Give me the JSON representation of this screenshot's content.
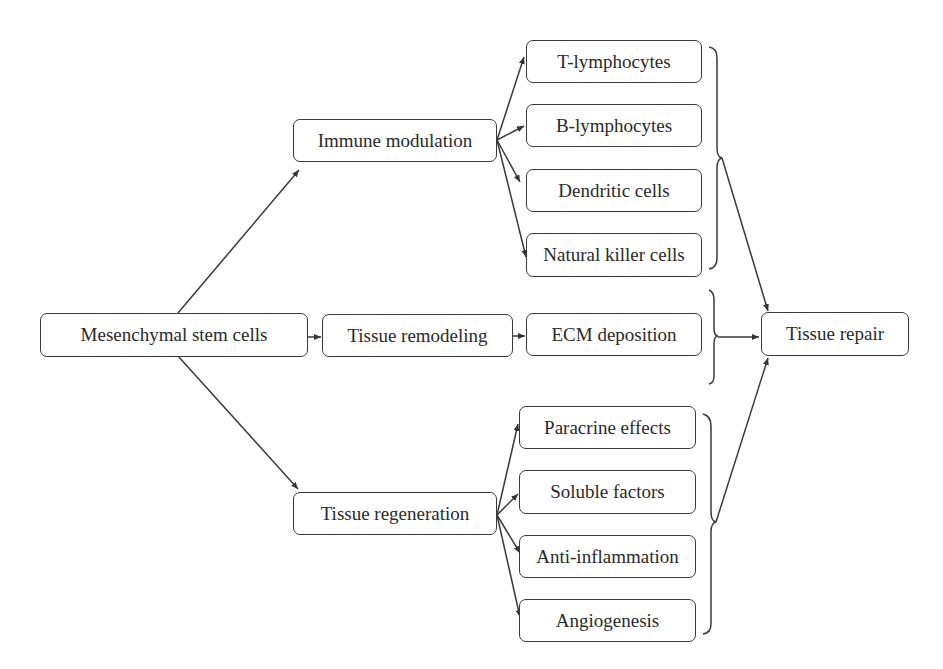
{
  "diagram": {
    "type": "flowchart",
    "root": {
      "id": "msc",
      "label": "Mesenchymal stem cells"
    },
    "branches": [
      {
        "id": "immune",
        "label": "Immune modulation",
        "children": [
          {
            "id": "t",
            "label": "T-lymphocytes"
          },
          {
            "id": "b",
            "label": "B-lymphocytes"
          },
          {
            "id": "dc",
            "label": "Dendritic cells"
          },
          {
            "id": "nk",
            "label": "Natural killer cells"
          }
        ]
      },
      {
        "id": "remodel",
        "label": "Tissue remodeling",
        "children": [
          {
            "id": "ecm",
            "label": "ECM deposition"
          }
        ]
      },
      {
        "id": "regen",
        "label": "Tissue regeneration",
        "children": [
          {
            "id": "para",
            "label": "Paracrine effects"
          },
          {
            "id": "sol",
            "label": "Soluble factors"
          },
          {
            "id": "anti",
            "label": "Anti-inflammation"
          },
          {
            "id": "angio",
            "label": "Angiogenesis"
          }
        ]
      }
    ],
    "outcome": {
      "id": "repair",
      "label": "Tissue repair"
    },
    "colors": {
      "stroke": "#3a3a3a",
      "text": "#2a2a2a",
      "background": "#ffffff"
    }
  }
}
